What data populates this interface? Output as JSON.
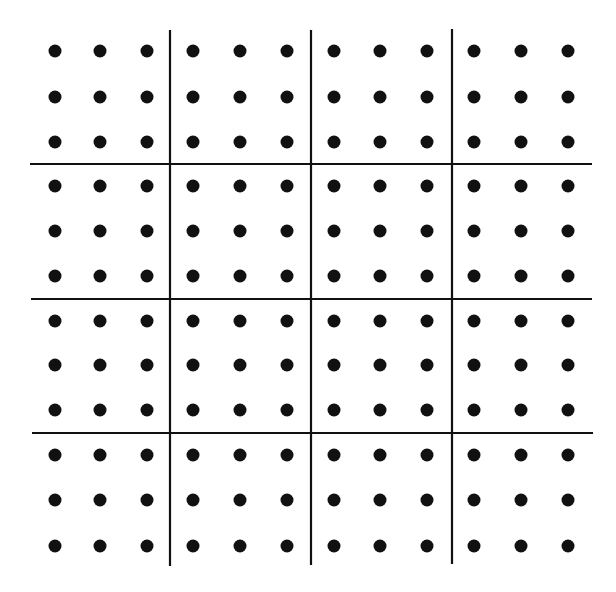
{
  "diagram": {
    "title": "",
    "grid": {
      "rows": 4,
      "cols": 4,
      "dots_per_cell": [
        3,
        3
      ]
    },
    "colors": {
      "background": "#ffffff",
      "ink": "#111111"
    },
    "dot_radius": 6.5,
    "line_width": 2.2,
    "vertical_lines": [
      {
        "x": 170,
        "y1": 30,
        "y2": 566
      },
      {
        "x": 311,
        "y1": 30,
        "y2": 565
      },
      {
        "x": 452,
        "y1": 29,
        "y2": 564
      }
    ],
    "horizontal_lines": [
      {
        "y": 164,
        "x1": 30,
        "x2": 592
      },
      {
        "y": 299,
        "x1": 31,
        "x2": 592
      },
      {
        "y": 433,
        "x1": 32,
        "x2": 593
      }
    ],
    "dot_columns": [
      55,
      100,
      147,
      193,
      240,
      287,
      334,
      380,
      427,
      474,
      521,
      568
    ],
    "dot_rows": [
      51,
      97,
      142,
      186,
      231,
      276,
      321,
      365,
      410,
      455,
      500,
      546
    ]
  }
}
